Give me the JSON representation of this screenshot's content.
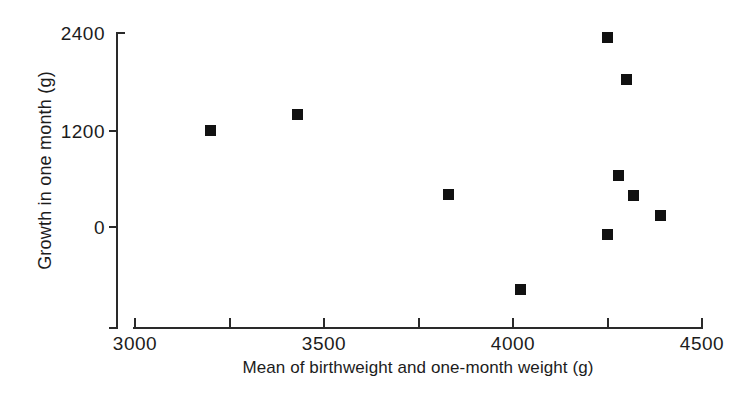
{
  "chart_data": {
    "type": "scatter",
    "title": "",
    "xlabel": "Mean of birthweight and one-month weight (g)",
    "ylabel": "Growth in one month (g)",
    "xlim": [
      3000,
      4500
    ],
    "ylim": [
      -1200,
      2400
    ],
    "xticks": [
      3000,
      3250,
      3500,
      3750,
      4000,
      4250,
      4500
    ],
    "xtick_labels": [
      "3000",
      "",
      "3500",
      "",
      "4000",
      "",
      "4500"
    ],
    "yticks": [
      0,
      1200,
      2400
    ],
    "ytick_labels": [
      "0",
      "1200",
      "2400"
    ],
    "grid": false,
    "legend": null,
    "marker": "filled-square",
    "marker_color": "#111111",
    "points": [
      {
        "x": 3200,
        "y": 1200
      },
      {
        "x": 3430,
        "y": 1390
      },
      {
        "x": 3830,
        "y": 400
      },
      {
        "x": 4020,
        "y": -770
      },
      {
        "x": 4250,
        "y": -90
      },
      {
        "x": 4250,
        "y": 2350
      },
      {
        "x": 4280,
        "y": 640
      },
      {
        "x": 4300,
        "y": 1820
      },
      {
        "x": 4320,
        "y": 390
      },
      {
        "x": 4390,
        "y": 140
      }
    ]
  },
  "axes": {
    "y_tick_labels": [
      "2400",
      "1200",
      "0"
    ],
    "x_tick_labels": [
      "3000",
      "3500",
      "4000",
      "4500"
    ],
    "y_title": "Growth in one month (g)",
    "x_title": "Mean of birthweight and one-month weight (g)"
  }
}
